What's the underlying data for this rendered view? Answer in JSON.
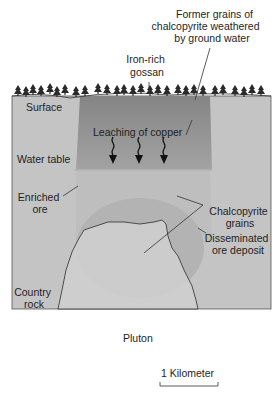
{
  "diagram": {
    "labels": {
      "former_grains": [
        "Former grains of",
        "chalcopyrite weathered",
        "by ground water"
      ],
      "gossan": [
        "Iron-rich",
        "gossan"
      ],
      "surface": "Surface",
      "leaching": "Leaching of copper",
      "water_table": "Water table",
      "enriched_ore": [
        "Enriched",
        "ore"
      ],
      "chalcopyrite_grains": [
        "Chalcopyrite",
        "grains"
      ],
      "disseminated": [
        "Disseminated",
        "ore deposit"
      ],
      "country_rock": [
        "Country",
        "rock"
      ],
      "pluton": "Pluton"
    },
    "scale_bar": {
      "label": "1 Kilometer"
    },
    "colors": {
      "country_rock": "#c4c4c4",
      "gossan_top": "#8a8a8a",
      "gossan_bottom": "#a6a6a6",
      "enriched": "#bcbcbc",
      "ore_deposit": "#b2b2b2",
      "pluton": "#cfcfcf",
      "outline": "#333333",
      "trees": "#2a2a2a"
    }
  }
}
